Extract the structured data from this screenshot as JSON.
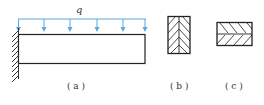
{
  "figure": {
    "load_label": "q",
    "labels": {
      "a": "( a )",
      "b": "( b )",
      "c": "( c )"
    },
    "colors": {
      "load": "#5aa8dc",
      "line": "#222222",
      "text": "#333333"
    },
    "panel_a": {
      "description": "Cantilever beam fixed at left wall with uniformly distributed load q",
      "arrow_count": 6
    },
    "panel_b": {
      "description": "Tall rectangular cross-section with vertical center line and herringbone hatching"
    },
    "panel_c": {
      "description": "Wide rectangular cross-section with horizontal center line and hatching"
    }
  }
}
